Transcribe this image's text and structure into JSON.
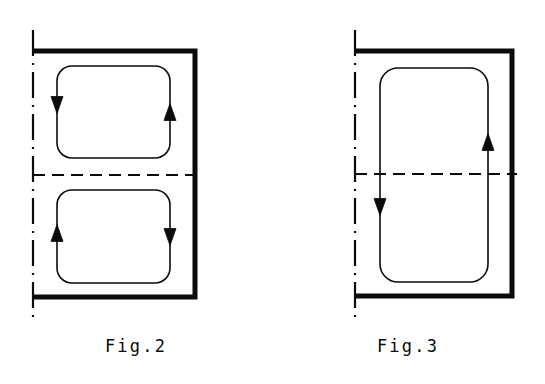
{
  "sheet": {
    "title": "Patent drawing sheet with Fig.2 and Fig.3",
    "background_color": "#ffffff",
    "ink_color": "#0b0b0b",
    "width": 545,
    "height": 384
  },
  "figures": [
    {
      "id": "fig-2",
      "caption": "Fig.2",
      "description": "Core cross-section with two stacked rounded rectangular flux loops, arrows circulating in opposite senses",
      "symmetry_axis": {
        "vertical_label": "center-line-vertical",
        "horizontal_label": "center-line-horizontal",
        "style": "dash-dot"
      },
      "frame": {
        "name": "c-core-outline",
        "style": "thick-solid",
        "opening_side": "left"
      },
      "loops": [
        {
          "name": "upper-flux-loop",
          "position": "upper",
          "arrows": [
            {
              "name": "arrow-upper-left",
              "side": "left",
              "direction": "down"
            },
            {
              "name": "arrow-upper-right",
              "side": "right",
              "direction": "up"
            }
          ],
          "circulation": "counter-clockwise"
        },
        {
          "name": "lower-flux-loop",
          "position": "lower",
          "arrows": [
            {
              "name": "arrow-lower-left",
              "side": "left",
              "direction": "up"
            },
            {
              "name": "arrow-lower-right",
              "side": "right",
              "direction": "down"
            }
          ],
          "circulation": "clockwise"
        }
      ]
    },
    {
      "id": "fig-3",
      "caption": "Fig.3",
      "description": "Core cross-section with a single tall rounded rectangular flux loop spanning both halves",
      "symmetry_axis": {
        "vertical_label": "center-line-vertical",
        "horizontal_label": "center-line-horizontal",
        "style": "dash-dot"
      },
      "frame": {
        "name": "c-core-outline",
        "style": "thick-solid",
        "opening_side": "left"
      },
      "loops": [
        {
          "name": "single-flux-loop",
          "position": "full-height",
          "arrows": [
            {
              "name": "arrow-left",
              "side": "left",
              "direction": "down"
            },
            {
              "name": "arrow-right",
              "side": "right",
              "direction": "up"
            }
          ],
          "circulation": "clockwise"
        }
      ]
    }
  ],
  "geometry": {
    "fig2": {
      "axis_x": 33,
      "axis_top": 30,
      "axis_bottom": 318,
      "frame_left": 33,
      "frame_right": 195,
      "frame_top": 51,
      "frame_bottom": 297,
      "center_y": 175,
      "dash_left": 33,
      "dash_right": 200,
      "upper_loop": {
        "x": 57,
        "y": 66,
        "w": 113,
        "h": 92,
        "r": 15
      },
      "lower_loop": {
        "x": 57,
        "y": 190,
        "w": 113,
        "h": 93,
        "r": 15
      },
      "arrows": [
        {
          "x": 57,
          "y": 105,
          "dir": "down"
        },
        {
          "x": 170,
          "y": 112,
          "dir": "up"
        },
        {
          "x": 57,
          "y": 233,
          "dir": "up"
        },
        {
          "x": 170,
          "y": 237,
          "dir": "down"
        }
      ]
    },
    "fig3": {
      "axis_x": 83,
      "axis_top": 30,
      "axis_bottom": 318,
      "frame_left": 83,
      "frame_right": 240,
      "frame_top": 51,
      "frame_bottom": 296,
      "center_y": 174,
      "dash_left": 83,
      "dash_right": 245,
      "loop": {
        "x": 108,
        "y": 68,
        "w": 108,
        "h": 214,
        "r": 18
      },
      "arrows": [
        {
          "x": 108,
          "y": 207,
          "dir": "down"
        },
        {
          "x": 216,
          "y": 142,
          "dir": "up"
        }
      ]
    }
  },
  "strokes": {
    "frame_width": 5,
    "loop_width": 1.6,
    "axis_width": 2.2,
    "dash_width": 2.0,
    "arrow_half_width": 6,
    "arrow_length": 17
  }
}
